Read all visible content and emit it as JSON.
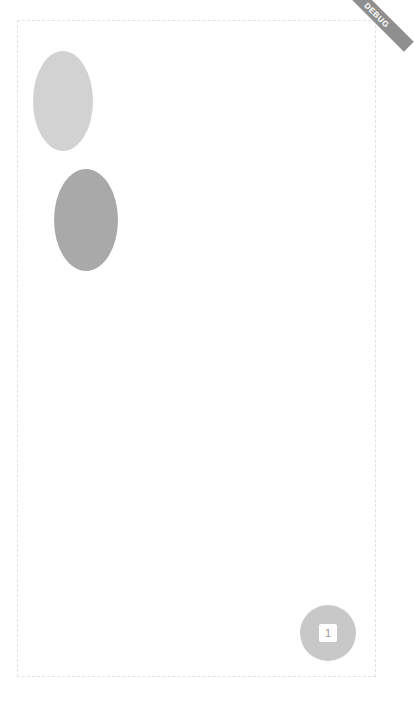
{
  "colors": {
    "ellipse_top": "#d2d2d2",
    "ellipse_bottom": "#a9a9a9",
    "fab": "#c8c8c8",
    "debug_banner": "#8f8f8f"
  },
  "debug_banner": {
    "label": "DEBUG"
  },
  "center_circle": {
    "label": "2"
  },
  "fab": {
    "label": "1"
  }
}
